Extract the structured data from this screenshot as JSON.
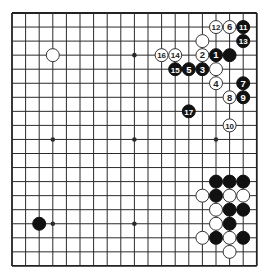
{
  "board": {
    "size": 19,
    "origin_x": 12,
    "origin_y": 13,
    "spacing_x": 13.6,
    "spacing_y": 14.05,
    "line_color": "#2b2b2b",
    "edge_color": "#222222",
    "background": "#ffffff",
    "star_points": [
      [
        3,
        3
      ],
      [
        9,
        3
      ],
      [
        15,
        3
      ],
      [
        3,
        9
      ],
      [
        9,
        9
      ],
      [
        15,
        9
      ],
      [
        3,
        15
      ],
      [
        9,
        15
      ],
      [
        15,
        15
      ]
    ]
  },
  "colors": {
    "black_stone": "#111111",
    "white_stone": "#ffffff",
    "white_outline": "#333333",
    "label_on_black": "#ffffff",
    "label_on_white": "#222222"
  },
  "stones": [
    {
      "col": 3,
      "row": 3,
      "color": "white",
      "label": ""
    },
    {
      "col": 14,
      "row": 2,
      "color": "white",
      "label": ""
    },
    {
      "col": 15,
      "row": 1,
      "color": "white",
      "label": "12"
    },
    {
      "col": 16,
      "row": 1,
      "color": "white",
      "label": "6"
    },
    {
      "col": 17,
      "row": 1,
      "color": "black",
      "label": "11"
    },
    {
      "col": 17,
      "row": 2,
      "color": "black",
      "label": "13"
    },
    {
      "col": 11,
      "row": 3,
      "color": "white",
      "label": "16"
    },
    {
      "col": 12,
      "row": 3,
      "color": "white",
      "label": "14"
    },
    {
      "col": 14,
      "row": 3,
      "color": "white",
      "label": "2"
    },
    {
      "col": 15,
      "row": 3,
      "color": "black",
      "label": "1"
    },
    {
      "col": 16,
      "row": 3,
      "color": "black",
      "label": ""
    },
    {
      "col": 12,
      "row": 4,
      "color": "black",
      "label": "15"
    },
    {
      "col": 13,
      "row": 4,
      "color": "black",
      "label": "5"
    },
    {
      "col": 14,
      "row": 4,
      "color": "black",
      "label": "3"
    },
    {
      "col": 15,
      "row": 4,
      "color": "white",
      "label": ""
    },
    {
      "col": 15,
      "row": 5,
      "color": "white",
      "label": "4"
    },
    {
      "col": 17,
      "row": 5,
      "color": "black",
      "label": "7"
    },
    {
      "col": 16,
      "row": 6,
      "color": "white",
      "label": "8"
    },
    {
      "col": 17,
      "row": 6,
      "color": "black",
      "label": "9"
    },
    {
      "col": 13,
      "row": 7,
      "color": "black",
      "label": "17"
    },
    {
      "col": 16,
      "row": 8,
      "color": "white",
      "label": "10"
    },
    {
      "col": 15,
      "row": 12,
      "color": "black",
      "label": ""
    },
    {
      "col": 16,
      "row": 12,
      "color": "black",
      "label": ""
    },
    {
      "col": 17,
      "row": 12,
      "color": "black",
      "label": ""
    },
    {
      "col": 14,
      "row": 13,
      "color": "white",
      "label": ""
    },
    {
      "col": 15,
      "row": 13,
      "color": "black",
      "label": ""
    },
    {
      "col": 16,
      "row": 13,
      "color": "white",
      "label": ""
    },
    {
      "col": 17,
      "row": 13,
      "color": "white",
      "label": ""
    },
    {
      "col": 15,
      "row": 14,
      "color": "white",
      "label": ""
    },
    {
      "col": 16,
      "row": 14,
      "color": "black",
      "label": ""
    },
    {
      "col": 17,
      "row": 14,
      "color": "black",
      "label": ""
    },
    {
      "col": 15,
      "row": 15,
      "color": "white",
      "label": ""
    },
    {
      "col": 16,
      "row": 15,
      "color": "black",
      "label": ""
    },
    {
      "col": 14,
      "row": 16,
      "color": "white",
      "label": ""
    },
    {
      "col": 15,
      "row": 16,
      "color": "black",
      "label": ""
    },
    {
      "col": 16,
      "row": 16,
      "color": "white",
      "label": ""
    },
    {
      "col": 17,
      "row": 16,
      "color": "black",
      "label": ""
    },
    {
      "col": 16,
      "row": 17,
      "color": "white",
      "label": ""
    },
    {
      "col": 2,
      "row": 15,
      "color": "black",
      "label": ""
    }
  ]
}
